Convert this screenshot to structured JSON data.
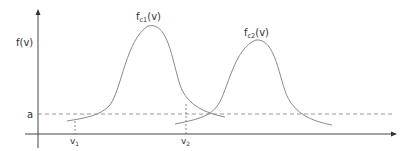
{
  "diagram": {
    "y_axis_label": "f(v)",
    "threshold_label": "a",
    "curves": [
      {
        "name": "f",
        "subscript": "c1",
        "suffix": "(v)"
      },
      {
        "name": "f",
        "subscript": "c2",
        "suffix": "(v)"
      }
    ],
    "x_markers": [
      {
        "name": "v",
        "subscript": "1"
      },
      {
        "name": "v",
        "subscript": "2"
      }
    ],
    "colors": {
      "axis": "#444444",
      "curve": "#8a8a8a",
      "dashed": "#9a9a9a",
      "text": "#333333"
    }
  }
}
